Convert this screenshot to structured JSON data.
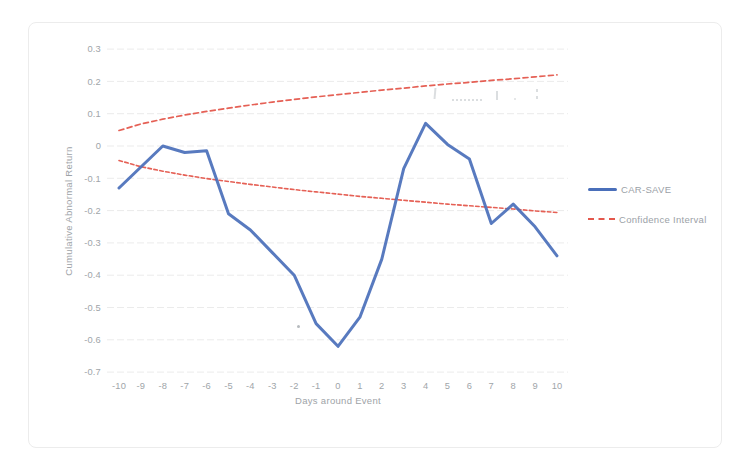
{
  "page": {
    "background": "#ffffff"
  },
  "chart_data": {
    "type": "line",
    "title": "",
    "xlabel": "Days around Event",
    "ylabel": "Cumulative Abnormal Return",
    "categories": [
      -10,
      -9,
      -8,
      -7,
      -6,
      -5,
      -4,
      -3,
      -2,
      -1,
      0,
      1,
      2,
      3,
      4,
      5,
      6,
      7,
      8,
      9,
      10
    ],
    "ylim": [
      -0.7,
      0.3
    ],
    "yticks": [
      0.3,
      0.2,
      0.1,
      0,
      -0.1,
      -0.2,
      -0.3,
      -0.4,
      -0.5,
      -0.6,
      -0.7
    ],
    "grid": true,
    "axis_text_color": "#a0a5a9",
    "grid_color": "#ebebeb",
    "series": [
      {
        "name": "CAR-SAVE",
        "color": "#4a6fba",
        "line_style": "solid",
        "line_width": 3,
        "values": [
          -0.13,
          -0.065,
          0,
          -0.02,
          -0.015,
          -0.21,
          -0.26,
          -0.33,
          -0.4,
          -0.55,
          -0.62,
          -0.53,
          -0.35,
          -0.07,
          0.07,
          0.005,
          -0.04,
          -0.24,
          -0.18,
          -0.25,
          -0.34
        ]
      },
      {
        "name": "Confidence Interval (upper)",
        "color": "#e4574c",
        "line_style": "dashed",
        "line_width": 1.7,
        "values": [
          0.048,
          0.068,
          0.083,
          0.096,
          0.107,
          0.117,
          0.127,
          0.136,
          0.144,
          0.152,
          0.159,
          0.166,
          0.173,
          0.179,
          0.186,
          0.192,
          0.197,
          0.203,
          0.208,
          0.214,
          0.22
        ]
      },
      {
        "name": "Confidence Interval (lower)",
        "color": "#e4574c",
        "line_style": "dashed",
        "line_width": 1.6,
        "values": [
          -0.045,
          -0.064,
          -0.078,
          -0.09,
          -0.101,
          -0.11,
          -0.119,
          -0.127,
          -0.135,
          -0.142,
          -0.149,
          -0.156,
          -0.162,
          -0.168,
          -0.174,
          -0.18,
          -0.185,
          -0.19,
          -0.195,
          -0.201,
          -0.206
        ]
      }
    ],
    "legend": {
      "position": "right",
      "entries": [
        {
          "label": "CAR-SAVE",
          "marker": "solid-line",
          "color": "#4a6fba"
        },
        {
          "label": "Confidence Interval",
          "marker": "dashed-line",
          "color": "#e4574c"
        }
      ]
    }
  }
}
